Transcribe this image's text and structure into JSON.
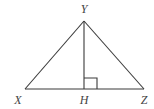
{
  "diagram": {
    "type": "triangle-with-altitude",
    "line_color": "#3a3a3a",
    "label_color": "#444444",
    "points": {
      "Y": {
        "label": "Y",
        "x": 84,
        "y": 21,
        "label_x": 84,
        "label_y": 13
      },
      "X": {
        "label": "X",
        "x": 25,
        "y": 89,
        "label_x": 18,
        "label_y": 104
      },
      "H": {
        "label": "H",
        "x": 84,
        "y": 89,
        "label_x": 84,
        "label_y": 104
      },
      "Z": {
        "label": "Z",
        "x": 144,
        "y": 89,
        "label_x": 144,
        "label_y": 104
      }
    },
    "segments": [
      "XY",
      "YZ",
      "XZ",
      "YH"
    ],
    "right_angle_marker": {
      "at": "H",
      "size": 13
    }
  }
}
